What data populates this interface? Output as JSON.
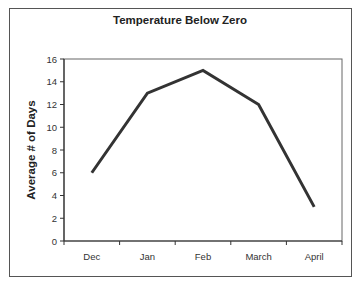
{
  "chart_data": {
    "type": "line",
    "title": "Temperature Below Zero",
    "xlabel": "",
    "ylabel": "Average # of Days",
    "categories": [
      "Dec",
      "Jan",
      "Feb",
      "March",
      "April"
    ],
    "series": [
      {
        "name": "Average # of Days",
        "values": [
          6,
          13,
          15,
          12,
          3
        ]
      }
    ],
    "ylim": [
      0,
      16
    ],
    "yticks": [
      0,
      2,
      4,
      6,
      8,
      10,
      12,
      14,
      16
    ],
    "grid": false,
    "legend": "none",
    "line_color": "#333333"
  }
}
